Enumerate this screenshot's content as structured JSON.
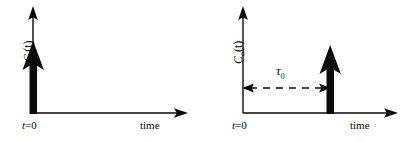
{
  "figure": {
    "background_color": "#ffffff",
    "stroke_color": "#0a0a0a",
    "panels": [
      {
        "id": "input",
        "y_axis_label_main": "C",
        "y_axis_label_sub": "i",
        "y_axis_label_paren": "(t)",
        "origin_label": "t",
        "origin_label_eq": "=0",
        "x_axis_label": "time",
        "impulse_position_label": "0",
        "annotation": null
      },
      {
        "id": "output",
        "y_axis_label_main": "C",
        "y_axis_label_sub": "o",
        "y_axis_label_paren": "(t)",
        "origin_label": "t",
        "origin_label_eq": "=0",
        "x_axis_label": "time",
        "impulse_position_label": "τ₀",
        "annotation": {
          "symbol": "τ",
          "symbol_sub": "0",
          "style": "dashed-double-arrow"
        }
      }
    ]
  }
}
